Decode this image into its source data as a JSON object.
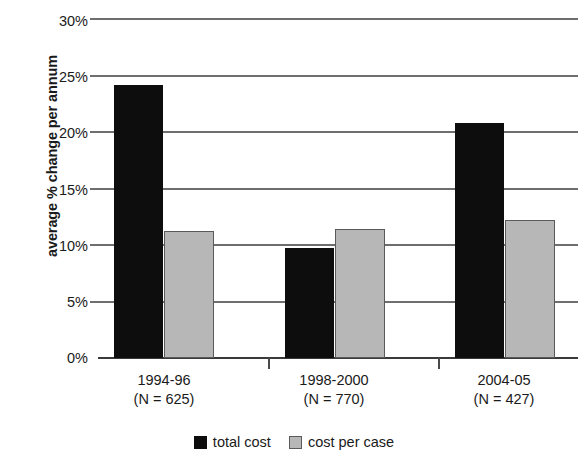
{
  "chart_data": {
    "type": "bar",
    "title": "",
    "xlabel": "",
    "ylabel": "average % change per annum",
    "categories": [
      "1994-96",
      "1998-2000",
      "2004-05"
    ],
    "category_sublabels": [
      "(N = 625)",
      "(N = 770)",
      "(N = 427)"
    ],
    "series": [
      {
        "name": "total cost",
        "color": "#0d0d0d",
        "values": [
          24.2,
          9.7,
          20.8
        ]
      },
      {
        "name": "cost per case",
        "color": "#b7b7b7",
        "values": [
          11.2,
          11.4,
          12.2
        ]
      }
    ],
    "ylim": [
      0,
      30
    ],
    "ytick_values": [
      30,
      25,
      20,
      15,
      10,
      5,
      0
    ],
    "ytick_labels": [
      "30%",
      "25%",
      "20%",
      "15%",
      "10%",
      "5%",
      "0%"
    ],
    "grid": true,
    "legend_position": "bottom"
  },
  "legend": {
    "items": [
      {
        "label": "total cost"
      },
      {
        "label": "cost per case"
      }
    ]
  }
}
